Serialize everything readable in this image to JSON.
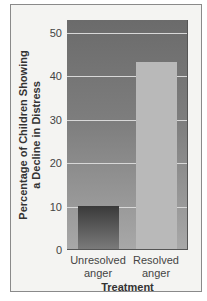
{
  "chart_data": {
    "type": "bar",
    "title": "",
    "categories": [
      "Unresolved anger",
      "Resolved anger"
    ],
    "category_lines": [
      [
        "Unresolved",
        "anger"
      ],
      [
        "Resolved",
        "anger"
      ]
    ],
    "values": [
      10,
      43
    ],
    "xlabel": "Treatment",
    "ylabel_lines": [
      "Percentage of Children Showing",
      "a Decline in Distress"
    ],
    "ylabel": "Percentage of Children Showing a Decline in Distress",
    "yticks": [
      0,
      10,
      20,
      30,
      40,
      50
    ],
    "ylim": [
      0,
      53
    ],
    "grid": true,
    "legend": null,
    "colors": {
      "plot_bg_top": "#6b6b6b",
      "plot_bg_bottom": "#a8a8a8",
      "bar_unresolved": "#4a4a4a",
      "bar_resolved": "#b9b9b9",
      "gridline": "#d8d8d8"
    }
  }
}
